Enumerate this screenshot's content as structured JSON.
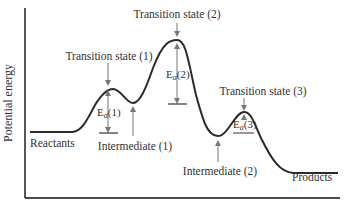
{
  "diagram": {
    "type": "reaction-energy-profile",
    "axes": {
      "y_label": "Potential energy",
      "x_label": ""
    },
    "labels": {
      "reactants": "Reactants",
      "products": "Products",
      "ts1": "Transition state (1)",
      "ts2": "Transition state (2)",
      "ts3": "Transition state (3)",
      "int1": "Intermediate (1)",
      "int2": "Intermediate (2)",
      "ea1_base": "E",
      "ea1_sub": "a",
      "ea1_num": "(1)",
      "ea2_base": "E",
      "ea2_sub": "a",
      "ea2_num": "(2)",
      "ea3_base": "E",
      "ea3_sub": "a",
      "ea3_num": "(3)"
    },
    "colors": {
      "curve": "#2a2a2a",
      "arrow": "#777777",
      "text": "#333333",
      "axis": "#111111"
    }
  }
}
